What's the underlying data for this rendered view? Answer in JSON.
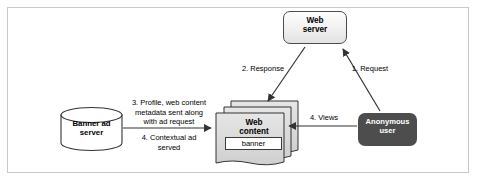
{
  "diagram": {
    "background_color": "#ffffff",
    "frame_border_color": "#c9c9c9",
    "nodes": [
      {
        "id": "web-server",
        "label": "Web\nserver",
        "shape": "rounded-rectangle",
        "fill": "#f0f0f0",
        "stroke": "#4c4c4c",
        "text_color": "#000000"
      },
      {
        "id": "banner-ad-server",
        "label": "Banner ad\nserver",
        "shape": "cylinder-database",
        "fill": "#ffffff",
        "stroke": "#333333",
        "text_color": "#000000"
      },
      {
        "id": "web-content",
        "label": "Web\ncontent",
        "shape": "document-stack",
        "fill": "#d9d9d9",
        "stroke": "#333333",
        "text_color": "#000000"
      },
      {
        "id": "banner",
        "label": "banner",
        "shape": "rectangle",
        "fill": "#ffffff",
        "stroke": "#3a3a3a",
        "text_color": "#000000"
      },
      {
        "id": "anonymous-user",
        "label": "Anonymous\nuser",
        "shape": "rounded-rectangle",
        "fill": "#4d4d4d",
        "stroke": "#4d4d4d",
        "text_color": "#ffffff"
      }
    ],
    "edges": [
      {
        "id": "request",
        "label": "1. Request",
        "from": "anonymous-user",
        "to": "web-server",
        "direction": "up-left"
      },
      {
        "id": "response",
        "label": "2. Response",
        "from": "web-server",
        "to": "web-content",
        "direction": "down-left"
      },
      {
        "id": "profile-metadata",
        "label": "3. Profile, web content\nmetadata sent along\nwith ad request",
        "from": "banner-ad-server",
        "to": "web-content",
        "direction": "right"
      },
      {
        "id": "contextual-ad",
        "label": "4. Contextual ad\nserved",
        "from": "banner-ad-server",
        "to": "web-content",
        "direction": "right"
      },
      {
        "id": "views",
        "label": "4. Views",
        "from": "anonymous-user",
        "to": "web-content",
        "direction": "left"
      }
    ]
  }
}
